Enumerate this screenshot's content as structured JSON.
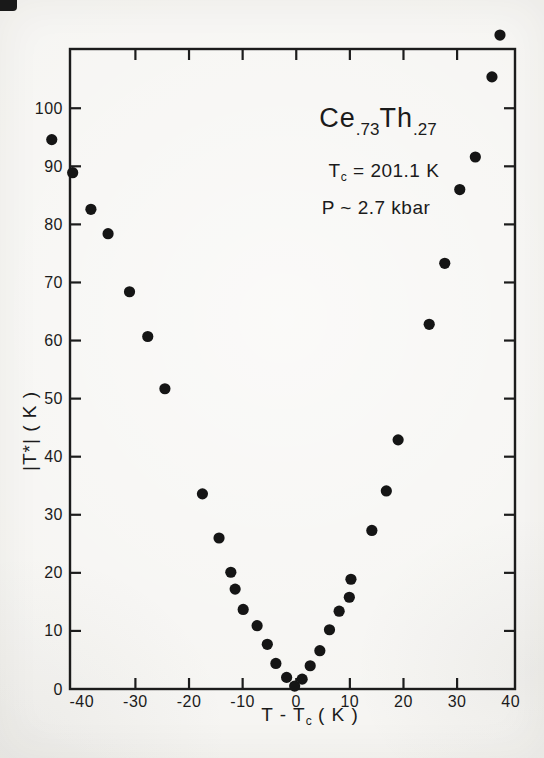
{
  "chart_data": {
    "type": "scatter",
    "title": "Ce.73Th.27",
    "title_parts": {
      "el1": "Ce",
      "sub1": ".73",
      "el2": "Th",
      "sub2": ".27"
    },
    "annotation_tc": {
      "pre": "T",
      "sub": "c",
      "post": " = 201.1 K"
    },
    "annotation_pressure": "P ~ 2.7 kbar",
    "xlabel": "T - Tc ( K )",
    "xlabel_parts": {
      "pre": "T - T",
      "sub": "c",
      "post": " ( K )"
    },
    "ylabel": "|T*| ( K )",
    "xlim": [
      -42.2,
      40.8
    ],
    "ylim": [
      0,
      110.2
    ],
    "x_ticks": [
      -40,
      -30,
      -20,
      -10,
      0,
      10,
      20,
      30,
      40
    ],
    "y_ticks": [
      0,
      10,
      20,
      30,
      40,
      50,
      60,
      70,
      80,
      90,
      100
    ],
    "grid": false,
    "legend": "none",
    "axis_color": "#1c1c1c",
    "point_color": "#151515",
    "point_radius": 5.6,
    "points": [
      [
        -45.6,
        94.6
      ],
      [
        -41.7,
        88.9
      ],
      [
        -38.3,
        82.6
      ],
      [
        -35.1,
        78.4
      ],
      [
        -31.1,
        68.4
      ],
      [
        -27.7,
        60.7
      ],
      [
        -24.5,
        51.7
      ],
      [
        -17.5,
        33.6
      ],
      [
        -14.4,
        26.0
      ],
      [
        -12.2,
        20.1
      ],
      [
        -11.4,
        17.2
      ],
      [
        -9.9,
        13.7
      ],
      [
        -7.3,
        10.9
      ],
      [
        -5.4,
        7.7
      ],
      [
        -3.8,
        4.4
      ],
      [
        -1.8,
        2.0
      ],
      [
        -0.3,
        0.5
      ],
      [
        1.1,
        1.7
      ],
      [
        2.6,
        4.0
      ],
      [
        4.4,
        6.6
      ],
      [
        6.2,
        10.2
      ],
      [
        8.0,
        13.4
      ],
      [
        9.9,
        15.8
      ],
      [
        10.2,
        18.9
      ],
      [
        14.1,
        27.3
      ],
      [
        16.8,
        34.1
      ],
      [
        19.0,
        42.9
      ],
      [
        24.8,
        62.8
      ],
      [
        27.7,
        73.3
      ],
      [
        30.5,
        86.0
      ],
      [
        33.4,
        91.6
      ],
      [
        36.5,
        105.4
      ],
      [
        38.0,
        112.6
      ]
    ]
  }
}
